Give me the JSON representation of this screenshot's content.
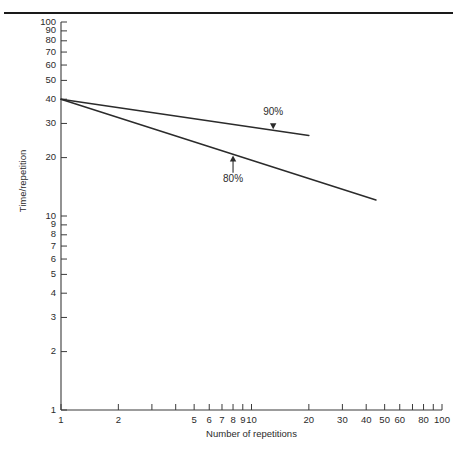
{
  "figure": {
    "top_rule": "horizontal-rule",
    "background_color": "#ffffff",
    "line_color": "#2b2b2b"
  },
  "chart_data": {
    "type": "line",
    "title": "",
    "xlabel": "Number of repetitions",
    "ylabel": "Time/repetition",
    "xscale": "log",
    "yscale": "log",
    "xlim": [
      1,
      100
    ],
    "ylim": [
      1,
      100
    ],
    "grid": false,
    "legend": "none",
    "xticks": [
      1,
      2,
      3,
      4,
      5,
      6,
      7,
      8,
      9,
      10,
      20,
      30,
      40,
      50,
      60,
      70,
      80,
      90,
      100
    ],
    "xtick_labels": [
      "1",
      "2",
      "",
      "",
      "5",
      "6",
      "7",
      "8",
      "9",
      "10",
      "20",
      "30",
      "40",
      "50",
      "60",
      "",
      "80",
      "",
      "100"
    ],
    "yticks": [
      1,
      2,
      3,
      4,
      5,
      6,
      7,
      8,
      9,
      10,
      20,
      30,
      40,
      50,
      60,
      70,
      80,
      90,
      100
    ],
    "ytick_labels": [
      "1",
      "2",
      "3",
      "4",
      "5",
      "6",
      "7",
      "8",
      "9",
      "10",
      "20",
      "30",
      "40",
      "50",
      "60",
      "70",
      "80",
      "90",
      "100"
    ],
    "series": [
      {
        "name": "90%",
        "learning_rate": 0.9,
        "first_unit_time": 40,
        "x": [
          1,
          20
        ],
        "y": [
          40,
          26.0
        ],
        "annotation": "90%",
        "annotation_arrow": "down"
      },
      {
        "name": "80%",
        "learning_rate": 0.8,
        "first_unit_time": 40,
        "x": [
          1,
          45
        ],
        "y": [
          40,
          12.1
        ],
        "annotation": "80%",
        "annotation_arrow": "up"
      }
    ],
    "annotations": [
      {
        "label": "90%",
        "x": 13.0,
        "y": 33.0,
        "arrow": "down",
        "target_x": 13.0,
        "target_y": 28.0
      },
      {
        "label": "80%",
        "x": 8.0,
        "y": 15.0,
        "arrow": "up",
        "target_x": 8.0,
        "target_y": 20.5
      }
    ]
  },
  "labels": {
    "y_axis_title": "Time/repetition",
    "x_axis_title": "Number of repetitions",
    "annotation_90": "90%",
    "annotation_80": "80%"
  }
}
